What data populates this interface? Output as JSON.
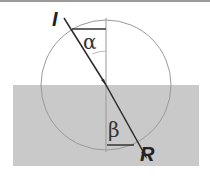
{
  "diagram": {
    "labels": {
      "incident": "I",
      "refracted": "R",
      "angle_incidence": "α",
      "angle_refraction": "β"
    },
    "colors": {
      "medium": "#c8c8c8",
      "circle": "#9a9a9a",
      "ray": "#2a2a2a",
      "normal": "#9a9a9a"
    }
  }
}
